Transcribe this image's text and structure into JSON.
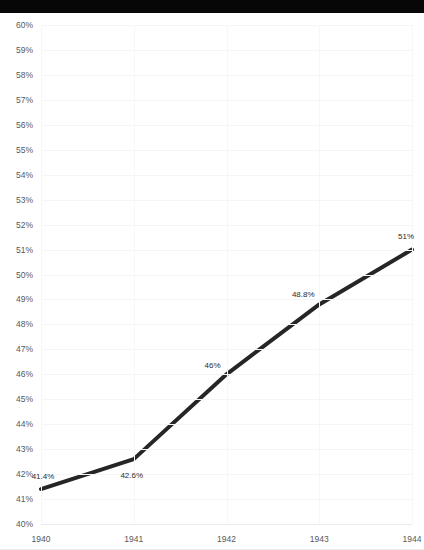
{
  "window": {
    "title_text": "",
    "right_text": ""
  },
  "chart_data": {
    "type": "line",
    "title": "",
    "subtitle": "",
    "xlabel": "",
    "ylabel": "",
    "x": [
      "1940",
      "1941",
      "1942",
      "1943",
      "1944"
    ],
    "categories": [
      "1940",
      "1941",
      "1942",
      "1943",
      "1944"
    ],
    "values": [
      41.4,
      42.6,
      46.0,
      48.8,
      51.0
    ],
    "point_labels": [
      "41.4%",
      "42.6%",
      "46%",
      "48.8%",
      "51%"
    ],
    "series": [
      {
        "name": "",
        "values": [
          41.4,
          42.6,
          46.0,
          48.8,
          51.0
        ]
      }
    ],
    "ylim": [
      40,
      60
    ],
    "ytick_values": [
      60,
      59,
      58,
      57,
      56,
      55,
      54,
      53,
      52,
      51,
      50,
      49,
      48,
      47,
      46,
      45,
      44,
      43,
      42,
      41,
      40
    ],
    "ytick_labels": [
      "60%",
      "59%",
      "58%",
      "57%",
      "56%",
      "55%",
      "54%",
      "53%",
      "52%",
      "51%",
      "50%",
      "49%",
      "48%",
      "47%",
      "46%",
      "45%",
      "44%",
      "43%",
      "42%",
      "41%",
      "40%"
    ],
    "xtick_labels": [
      "1940",
      "1941",
      "1942",
      "1943",
      "1944"
    ],
    "grid": {
      "horizontal": true,
      "vertical": true,
      "color": "#f4f5f7"
    },
    "legend": {
      "visible": false,
      "position": "none",
      "entries": []
    },
    "line_color": "#262626",
    "line_width_px": 4,
    "markers": false,
    "background_color": "#ffffff",
    "label_color": "#2b2b2b",
    "tick_color": "#58595b"
  }
}
